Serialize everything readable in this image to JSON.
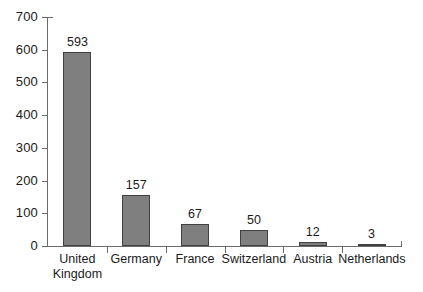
{
  "chart_data": {
    "type": "bar",
    "title": "",
    "subtitle": "",
    "xlabel": "",
    "ylabel": "",
    "categories": [
      "United Kingdom",
      "Germany",
      "France",
      "Switzerland",
      "Austria",
      "Netherlands"
    ],
    "values": [
      593,
      157,
      67,
      50,
      12,
      3
    ],
    "data_labels": [
      "593",
      "157",
      "67",
      "50",
      "12",
      "3"
    ],
    "ylim": [
      0,
      700
    ],
    "ytick_labels": [
      "700",
      "600",
      "500",
      "400",
      "300",
      "200",
      "100",
      "0"
    ],
    "ytick_values": [
      700,
      600,
      500,
      400,
      300,
      200,
      100,
      0
    ],
    "grid": false,
    "legend": null,
    "legend_position": "none",
    "annotations": [],
    "colors": {
      "bar_fill": "#7f7f7f",
      "bar_border": "#404040",
      "axis": "#6b6b6b",
      "text": "#1a1a1a",
      "background": "#ffffff"
    }
  }
}
